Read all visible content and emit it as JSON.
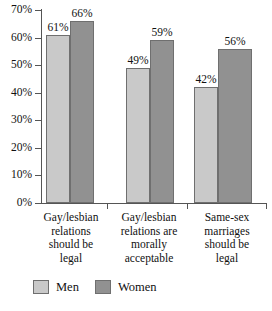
{
  "chart_data": {
    "type": "bar",
    "title": "",
    "xlabel": "",
    "ylabel": "",
    "ylim": [
      0,
      70
    ],
    "grid": false,
    "legend_position": "bottom-left",
    "categories": [
      "Gay/lesbian relations should be legal",
      "Gay/lesbian relations are morally acceptable",
      "Same-sex marriages should be legal"
    ],
    "category_lines": [
      [
        "Gay/lesbian",
        "relations",
        "should be",
        "legal"
      ],
      [
        "Gay/lesbian",
        "relations are",
        "morally",
        "acceptable"
      ],
      [
        "Same-sex",
        "marriages",
        "should be",
        "legal"
      ]
    ],
    "series": [
      {
        "name": "Men",
        "color": "#c9c9c9",
        "values": [
          61,
          49,
          42
        ],
        "labels": [
          "61%",
          "49%",
          "42%"
        ]
      },
      {
        "name": "Women",
        "color": "#919191",
        "values": [
          66,
          59,
          56
        ],
        "labels": [
          "66%",
          "59%",
          "56%"
        ]
      }
    ],
    "y_ticks": [
      0,
      10,
      20,
      30,
      40,
      50,
      60,
      70
    ],
    "y_tick_labels": [
      "0%",
      "10%",
      "20%",
      "30%",
      "40%",
      "50%",
      "60%",
      "70%"
    ]
  },
  "legend": {
    "items": [
      {
        "label": "Men",
        "swatch": "men-swatch"
      },
      {
        "label": "Women",
        "swatch": "women-swatch"
      }
    ]
  }
}
